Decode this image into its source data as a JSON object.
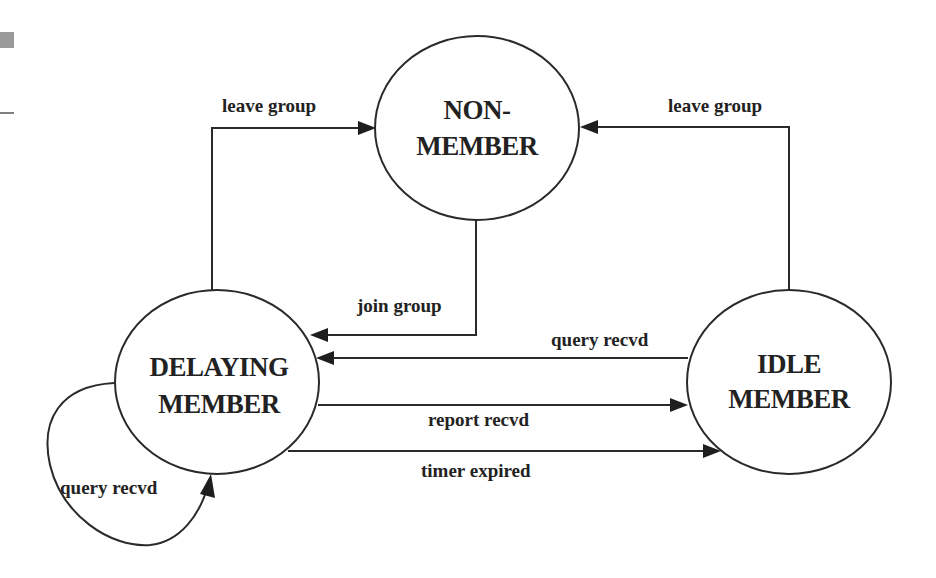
{
  "diagram": {
    "states": [
      {
        "id": "non_member",
        "line1": "NON-",
        "line2": "MEMBER"
      },
      {
        "id": "delaying_member",
        "line1": "DELAYING",
        "line2": "MEMBER"
      },
      {
        "id": "idle_member",
        "line1": "IDLE",
        "line2": "MEMBER"
      }
    ],
    "transitions": [
      {
        "from": "delaying_member",
        "to": "non_member",
        "label": "leave group"
      },
      {
        "from": "idle_member",
        "to": "non_member",
        "label": "leave group"
      },
      {
        "from": "non_member",
        "to": "delaying_member",
        "label": "join group"
      },
      {
        "from": "idle_member",
        "to": "delaying_member",
        "label": "query recvd"
      },
      {
        "from": "delaying_member",
        "to": "idle_member",
        "label": "report recvd"
      },
      {
        "from": "delaying_member",
        "to": "idle_member",
        "label": "timer expired"
      },
      {
        "from": "delaying_member",
        "to": "delaying_member",
        "label": "query recvd"
      }
    ],
    "colors": {
      "stroke": "#2a2a2a",
      "text": "#222222",
      "margin_mark": "#9a9a9a"
    }
  }
}
